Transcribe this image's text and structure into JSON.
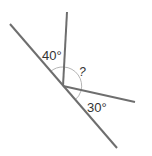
{
  "diagram": {
    "type": "angles-on-a-line",
    "vertex": {
      "x": 63,
      "y": 86
    },
    "colors": {
      "line": "#6e6e6e",
      "arc": "#b5b5b5",
      "text": "#333333"
    },
    "lines": [
      {
        "name": "straight-line",
        "x1": 10,
        "y1": 24,
        "x2": 117,
        "y2": 148
      },
      {
        "name": "upper-ray",
        "x1": 63,
        "y1": 86,
        "x2": 67,
        "y2": 12
      },
      {
        "name": "right-ray",
        "x1": 63,
        "y1": 86,
        "x2": 135,
        "y2": 102
      }
    ],
    "labels": {
      "angle_left": "40°",
      "angle_unknown": "?",
      "angle_right": "30°"
    }
  }
}
